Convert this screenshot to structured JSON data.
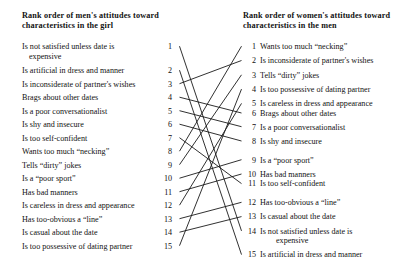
{
  "figure": {
    "type": "linked-rank-order-diagram",
    "background": "#ffffff",
    "line_color": "#1a1a1a"
  },
  "left_column": {
    "heading_line1": "Rank order of men's attitudes toward",
    "heading_line2": "characteristics in the girl",
    "items": [
      {
        "rank": "1",
        "text": "Is not satisfied unless date is",
        "continuation": "expensive"
      },
      {
        "rank": "2",
        "text": "Is artificial in dress and manner",
        "continuation": ""
      },
      {
        "rank": "3",
        "text": "Is inconsiderate of partner's wishes",
        "continuation": ""
      },
      {
        "rank": "4",
        "text": "Brags about other dates",
        "continuation": ""
      },
      {
        "rank": "5",
        "text": "Is a poor conversationalist",
        "continuation": ""
      },
      {
        "rank": "6",
        "text": "Is shy and insecure",
        "continuation": ""
      },
      {
        "rank": "7",
        "text": "Is too self-confident",
        "continuation": ""
      },
      {
        "rank": "8",
        "text": "Wants too much “necking”",
        "continuation": ""
      },
      {
        "rank": "9",
        "text": "Tells “dirty” jokes",
        "continuation": ""
      },
      {
        "rank": "10",
        "text": "Is a “poor sport”",
        "continuation": ""
      },
      {
        "rank": "11",
        "text": "Has bad manners",
        "continuation": ""
      },
      {
        "rank": "12",
        "text": "Is careless in dress and appearance",
        "continuation": ""
      },
      {
        "rank": "13",
        "text": "Has too-obvious a “line”",
        "continuation": ""
      },
      {
        "rank": "14",
        "text": "Is casual about the  date",
        "continuation": ""
      },
      {
        "rank": "15",
        "text": "Is too possessive of dating partner",
        "continuation": ""
      }
    ]
  },
  "right_column": {
    "heading_line1": "Rank order of women's attitudes toward",
    "heading_line2": "characteristics in the men",
    "items": [
      {
        "rank": "1",
        "text": "Wants too much “necking”",
        "continuation": ""
      },
      {
        "rank": "2",
        "text": "Is inconsiderate of partner's wishes",
        "continuation": ""
      },
      {
        "rank": "3",
        "text": "Tells “dirty” jokes",
        "continuation": ""
      },
      {
        "rank": "4",
        "text": "Is too possessive of dating partner",
        "continuation": ""
      },
      {
        "rank": "5",
        "text": "Is careless in dress and appearance",
        "continuation": ""
      },
      {
        "rank": "6",
        "text": "Brags about other dates",
        "continuation": ""
      },
      {
        "rank": "7",
        "text": "Is a poor conversationalist",
        "continuation": ""
      },
      {
        "rank": "8",
        "text": "Is shy and insecure",
        "continuation": ""
      },
      {
        "rank": "9",
        "text": "Is a “poor sport”",
        "continuation": ""
      },
      {
        "rank": "10",
        "text": "Has bad manners",
        "continuation": ""
      },
      {
        "rank": "11",
        "text": "Is too self-confident",
        "continuation": ""
      },
      {
        "rank": "12",
        "text": "Has too-obvious a “line”",
        "continuation": ""
      },
      {
        "rank": "13",
        "text": "Is casual about the date",
        "continuation": ""
      },
      {
        "rank": "14",
        "text": "Is not satisfied unless date is",
        "continuation": "expensive"
      },
      {
        "rank": "15",
        "text": "Is artificial in dress and manner",
        "continuation": ""
      }
    ]
  },
  "chart_data": {
    "type": "table",
    "links": [
      {
        "left_rank": 1,
        "right_rank": 14,
        "item": "Is not satisfied unless date is expensive"
      },
      {
        "left_rank": 2,
        "right_rank": 15,
        "item": "Is artificial in dress and manner"
      },
      {
        "left_rank": 3,
        "right_rank": 2,
        "item": "Is inconsiderate of partner's wishes"
      },
      {
        "left_rank": 4,
        "right_rank": 6,
        "item": "Brags about other dates"
      },
      {
        "left_rank": 5,
        "right_rank": 7,
        "item": "Is a poor conversationalist"
      },
      {
        "left_rank": 6,
        "right_rank": 8,
        "item": "Is shy and insecure"
      },
      {
        "left_rank": 7,
        "right_rank": 11,
        "item": "Is too self-confident"
      },
      {
        "left_rank": 8,
        "right_rank": 1,
        "item": "Wants too much “necking”"
      },
      {
        "left_rank": 9,
        "right_rank": 3,
        "item": "Tells “dirty” jokes"
      },
      {
        "left_rank": 10,
        "right_rank": 9,
        "item": "Is a “poor sport”"
      },
      {
        "left_rank": 11,
        "right_rank": 10,
        "item": "Has bad manners"
      },
      {
        "left_rank": 12,
        "right_rank": 5,
        "item": "Is careless in dress and appearance"
      },
      {
        "left_rank": 13,
        "right_rank": 12,
        "item": "Has too-obvious a “line”"
      },
      {
        "left_rank": 14,
        "right_rank": 13,
        "item": "Is casual about the date"
      },
      {
        "left_rank": 15,
        "right_rank": 4,
        "item": "Is too possessive of dating partner"
      }
    ]
  }
}
